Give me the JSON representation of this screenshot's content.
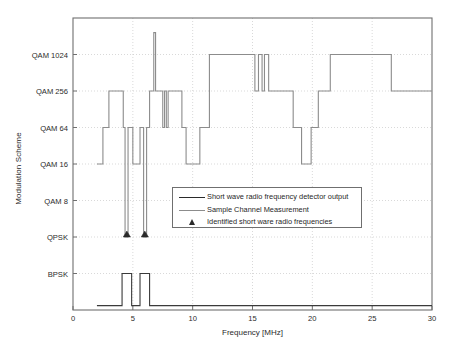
{
  "chart_data": {
    "type": "line",
    "title": "",
    "xlabel": "Frequency [MHz]",
    "ylabel": "Modulation Scheme",
    "xlim": [
      0,
      30
    ],
    "xticks": [
      0,
      5,
      10,
      15,
      20,
      25,
      30
    ],
    "xtick_labels": [
      "0",
      "5",
      "10",
      "15",
      "20",
      "25",
      "30"
    ],
    "ytick_labels": [
      "BPSK",
      "QPSK",
      "QAM 8",
      "QAM 16",
      "QAM 64",
      "QAM 256",
      "QAM 1024"
    ],
    "ylevels": [
      1,
      2,
      3,
      4,
      5,
      6,
      7
    ],
    "ylim": [
      0,
      8
    ],
    "grid": true,
    "grid_style": "dotted",
    "legend_position": "center",
    "legend": [
      {
        "label": "Short wave radio frequency detector output",
        "marker": "line",
        "color": "#2a2a2a"
      },
      {
        "label": "Sample Channel Measurement",
        "marker": "line",
        "color": "#8c8c8c"
      },
      {
        "label": "Identified short ware radio frequencies",
        "marker": "triangle",
        "color": "#2a2a2a"
      }
    ],
    "series": [
      {
        "name": "Sample Channel Measurement",
        "type": "step",
        "color": "#8c8c8c",
        "points": [
          [
            2.0,
            4
          ],
          [
            2.5,
            4
          ],
          [
            2.5,
            5
          ],
          [
            3.0,
            5
          ],
          [
            3.0,
            6
          ],
          [
            4.2,
            6
          ],
          [
            4.2,
            5
          ],
          [
            4.35,
            5
          ],
          [
            4.35,
            2
          ],
          [
            4.6,
            2
          ],
          [
            4.6,
            5
          ],
          [
            5.0,
            5
          ],
          [
            5.0,
            4
          ],
          [
            5.6,
            4
          ],
          [
            5.6,
            5
          ],
          [
            5.9,
            5
          ],
          [
            5.9,
            2
          ],
          [
            6.15,
            2
          ],
          [
            6.15,
            5
          ],
          [
            6.4,
            5
          ],
          [
            6.4,
            6
          ],
          [
            6.75,
            6
          ],
          [
            6.75,
            7.6
          ],
          [
            6.9,
            7.6
          ],
          [
            6.9,
            6
          ],
          [
            7.5,
            6
          ],
          [
            7.5,
            5
          ],
          [
            7.65,
            5
          ],
          [
            7.65,
            6
          ],
          [
            7.8,
            6
          ],
          [
            7.8,
            5
          ],
          [
            7.95,
            5
          ],
          [
            7.95,
            6
          ],
          [
            9.1,
            6
          ],
          [
            9.1,
            5
          ],
          [
            9.45,
            5
          ],
          [
            9.45,
            4
          ],
          [
            10.6,
            4
          ],
          [
            10.6,
            5
          ],
          [
            11.4,
            5
          ],
          [
            11.4,
            7
          ],
          [
            15.2,
            7
          ],
          [
            15.2,
            6
          ],
          [
            15.5,
            6
          ],
          [
            15.5,
            7
          ],
          [
            15.8,
            7
          ],
          [
            15.8,
            6
          ],
          [
            16.0,
            6
          ],
          [
            16.0,
            7
          ],
          [
            16.35,
            7
          ],
          [
            16.35,
            6
          ],
          [
            18.4,
            6
          ],
          [
            18.4,
            5
          ],
          [
            19.1,
            5
          ],
          [
            19.1,
            4
          ],
          [
            19.9,
            4
          ],
          [
            19.9,
            5
          ],
          [
            20.5,
            5
          ],
          [
            20.5,
            6
          ],
          [
            21.5,
            6
          ],
          [
            21.5,
            7
          ],
          [
            26.6,
            7
          ],
          [
            26.6,
            6
          ],
          [
            30.0,
            6
          ]
        ]
      },
      {
        "name": "Short wave radio frequency detector output",
        "type": "step",
        "color": "#3a3a3a",
        "points": [
          [
            2.0,
            0.12
          ],
          [
            4.1,
            0.12
          ],
          [
            4.1,
            1
          ],
          [
            4.9,
            1
          ],
          [
            4.9,
            0.12
          ],
          [
            5.6,
            0.12
          ],
          [
            5.6,
            1
          ],
          [
            6.4,
            1
          ],
          [
            6.4,
            0.12
          ],
          [
            30.0,
            0.12
          ]
        ]
      }
    ],
    "markers": [
      {
        "name": "Identified short ware radio frequencies",
        "x": 4.5,
        "y": 2,
        "shape": "triangle",
        "color": "#2a2a2a"
      },
      {
        "name": "Identified short ware radio frequencies",
        "x": 6.0,
        "y": 2,
        "shape": "triangle",
        "color": "#2a2a2a"
      }
    ]
  },
  "colors": {
    "axis": "#6f6f6f",
    "grid": "#c8c8c8",
    "measurement": "#8c8c8c",
    "detector": "#3a3a3a",
    "marker": "#2a2a2a",
    "text": "#2b2b2b"
  }
}
